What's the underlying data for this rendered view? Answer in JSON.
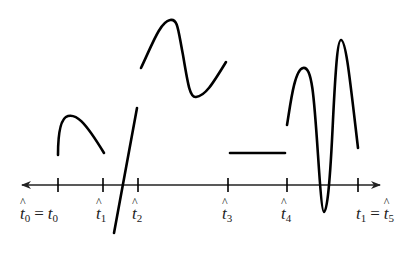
{
  "diagram": {
    "axis": {
      "y": 185,
      "x_start": 22,
      "x_end": 380,
      "arrows": "both",
      "color": "#222222"
    },
    "ticks": [
      {
        "x": 58,
        "label_main": "t",
        "label_sub": "0",
        "hat": true,
        "eq_main": "t",
        "eq_sub": "0",
        "eq_hat": false,
        "eq_text": "="
      },
      {
        "x": 103,
        "label_main": "t",
        "label_sub": "1",
        "hat": true
      },
      {
        "x": 138,
        "label_main": "t",
        "label_sub": "2",
        "hat": true
      },
      {
        "x": 228,
        "label_main": "t",
        "label_sub": "3",
        "hat": true
      },
      {
        "x": 287,
        "label_main": "t",
        "label_sub": "4",
        "hat": true
      },
      {
        "x": 358,
        "label_main": "t",
        "label_sub": "1",
        "hat": false,
        "eq_main": "t",
        "eq_sub": "5",
        "eq_hat": true,
        "eq_text": "="
      }
    ],
    "labels": {
      "t0_hat": "t",
      "t0_sub": "0",
      "eq": "=",
      "t0": "t",
      "t0_plain_sub": "0",
      "t1_hat": "t",
      "t1_sub": "1",
      "t2_hat": "t",
      "t2_sub": "2",
      "t3_hat": "t",
      "t3_sub": "3",
      "t4_hat": "t",
      "t4_sub": "4",
      "t1_plain": "t",
      "t1_plain_sub": "1",
      "t5_hat": "t",
      "t5_sub": "5"
    },
    "segments": [
      {
        "name": "segment-1-hump",
        "interval": "[t0_hat, t1_hat]",
        "path": "M58,155 C58,135 60,118 68,116 C76,114 84,120 104,153"
      },
      {
        "name": "segment-2-steep-line",
        "interval": "[t1_hat, t2_hat]",
        "path": "M137,108 L114,233"
      },
      {
        "name": "segment-3-wave",
        "interval": "[t2_hat, t3_hat]",
        "path": "M141,68 C152,45 160,22 170,20 C178,18 178,30 183,55 C188,85 190,98 196,97 C205,96 212,85 226,62"
      },
      {
        "name": "segment-4-flat",
        "interval": "[t3_hat, t4_hat]",
        "path": "M230,153 L285,153"
      },
      {
        "name": "segment-5-oscillation",
        "interval": "[t4_hat, t1]",
        "path": "M287,125 C290,108 294,70 303,68 C312,66 314,95 318,155 C320,185 322,212 324,212 C327,212 330,185 333,120 C336,60 338,40 341,40 C346,40 350,80 358,148"
      }
    ]
  }
}
